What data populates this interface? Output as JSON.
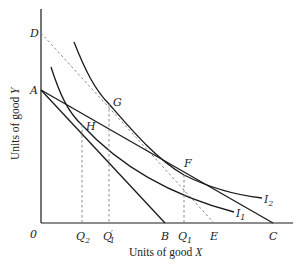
{
  "diagram": {
    "type": "indifference-curve budget-line diagram",
    "axes": {
      "x_label_prefix": "Units of good ",
      "x_label_var": "X",
      "y_label_prefix": "Units of good ",
      "y_label_var": "Y",
      "origin_label": "0"
    },
    "points": {
      "D": "D",
      "A": "A",
      "G": "G",
      "H": "H",
      "F": "F",
      "B": "B",
      "E": "E",
      "C": "C"
    },
    "x_ticks": {
      "Q2": {
        "main": "Q",
        "sub": "2"
      },
      "Q1_prime": {
        "main": "Q",
        "sub": "1",
        "prime": "′"
      },
      "Q1": {
        "main": "Q",
        "sub": "1"
      }
    },
    "curves": {
      "I1": {
        "main": "I",
        "sub": "1"
      },
      "I2": {
        "main": "I",
        "sub": "2"
      }
    },
    "colors": {
      "line": "#1a1a1a",
      "dashed": "#8a8a8a",
      "background": "#ffffff"
    }
  }
}
